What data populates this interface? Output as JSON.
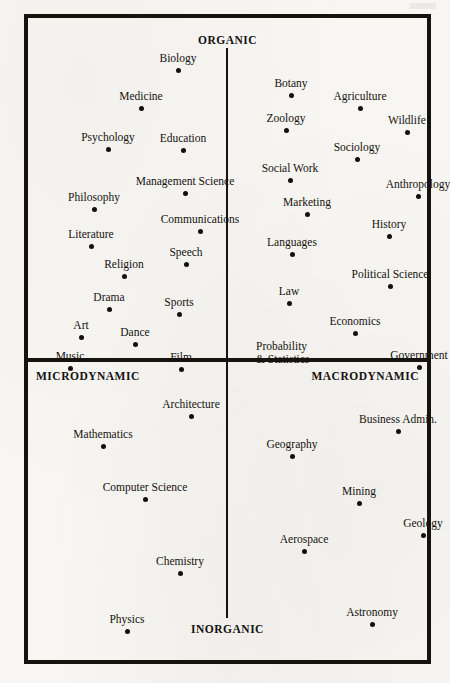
{
  "figure": {
    "type": "scatter",
    "poles": {
      "top": "ORGANIC",
      "bottom": "INORGANIC",
      "left": "MICRODYNAMIC",
      "right": "MACRODYNAMIC"
    }
  },
  "chart_data": {
    "type": "scatter",
    "title": "",
    "xlabel": "MICRODYNAMIC — MACRODYNAMIC",
    "ylabel": "INORGANIC — ORGANIC",
    "xlim": [
      -100,
      100
    ],
    "ylim": [
      -100,
      100
    ],
    "grid": false,
    "legend": null,
    "axis_poles": {
      "top": "ORGANIC",
      "bottom": "INORGANIC",
      "left": "MICRODYNAMIC",
      "right": "MACRODYNAMIC"
    },
    "quadrants": [
      {
        "name": "Organic / Microdynamic",
        "position": "top-left"
      },
      {
        "name": "Organic / Macrodynamic",
        "position": "top-right"
      },
      {
        "name": "Inorganic / Microdynamic",
        "position": "bottom-left"
      },
      {
        "name": "Inorganic / Macrodynamic",
        "position": "bottom-right"
      }
    ],
    "points": [
      {
        "label": "Biology",
        "px": 150,
        "py": 52,
        "quadrant": "top-left",
        "lbl": "above"
      },
      {
        "label": "Medicine",
        "px": 113,
        "py": 90,
        "quadrant": "top-left",
        "lbl": "above"
      },
      {
        "label": "Psychology",
        "px": 80,
        "py": 131,
        "quadrant": "top-left",
        "lbl": "above"
      },
      {
        "label": "Education",
        "px": 155,
        "py": 132,
        "quadrant": "top-left",
        "lbl": "above"
      },
      {
        "label": "Management Science",
        "px": 157,
        "py": 175,
        "quadrant": "top-left",
        "lbl": "above"
      },
      {
        "label": "Philosophy",
        "px": 66,
        "py": 191,
        "quadrant": "top-left",
        "lbl": "above"
      },
      {
        "label": "Communications",
        "px": 172,
        "py": 213,
        "quadrant": "top-left",
        "lbl": "above"
      },
      {
        "label": "Literature",
        "px": 63,
        "py": 228,
        "quadrant": "top-left",
        "lbl": "above"
      },
      {
        "label": "Speech",
        "px": 158,
        "py": 246,
        "quadrant": "top-left",
        "lbl": "above"
      },
      {
        "label": "Religion",
        "px": 96,
        "py": 258,
        "quadrant": "top-left",
        "lbl": "above"
      },
      {
        "label": "Drama",
        "px": 81,
        "py": 291,
        "quadrant": "top-left",
        "lbl": "above"
      },
      {
        "label": "Sports",
        "px": 151,
        "py": 296,
        "quadrant": "top-left",
        "lbl": "above"
      },
      {
        "label": "Art",
        "px": 53,
        "py": 319,
        "quadrant": "top-left",
        "lbl": "above"
      },
      {
        "label": "Dance",
        "px": 107,
        "py": 326,
        "quadrant": "top-left",
        "lbl": "above"
      },
      {
        "label": "Music",
        "px": 42,
        "py": 350,
        "quadrant": "top-left",
        "lbl": "above"
      },
      {
        "label": "Film",
        "px": 153,
        "py": 351,
        "quadrant": "top-left",
        "lbl": "above"
      },
      {
        "label": "Botany",
        "px": 263,
        "py": 77,
        "quadrant": "top-right",
        "lbl": "above"
      },
      {
        "label": "Agriculture",
        "px": 332,
        "py": 90,
        "quadrant": "top-right",
        "lbl": "above"
      },
      {
        "label": "Zoology",
        "px": 258,
        "py": 112,
        "quadrant": "top-right",
        "lbl": "above"
      },
      {
        "label": "Wildlife",
        "px": 379,
        "py": 114,
        "quadrant": "top-right",
        "lbl": "above"
      },
      {
        "label": "Sociology",
        "px": 329,
        "py": 141,
        "quadrant": "top-right",
        "lbl": "above"
      },
      {
        "label": "Social Work",
        "px": 262,
        "py": 162,
        "quadrant": "top-right",
        "lbl": "above"
      },
      {
        "label": "Anthropology",
        "px": 390,
        "py": 178,
        "quadrant": "top-right",
        "lbl": "above"
      },
      {
        "label": "Marketing",
        "px": 279,
        "py": 196,
        "quadrant": "top-right",
        "lbl": "above"
      },
      {
        "label": "History",
        "px": 361,
        "py": 218,
        "quadrant": "top-right",
        "lbl": "above"
      },
      {
        "label": "Languages",
        "px": 264,
        "py": 236,
        "quadrant": "top-right",
        "lbl": "above"
      },
      {
        "label": "Political Science",
        "px": 362,
        "py": 268,
        "quadrant": "top-right",
        "lbl": "above"
      },
      {
        "label": "Law",
        "px": 261,
        "py": 285,
        "quadrant": "top-right",
        "lbl": "above"
      },
      {
        "label": "Economics",
        "px": 327,
        "py": 315,
        "quadrant": "top-right",
        "lbl": "above"
      },
      {
        "label": "Probability\n& Statistics",
        "px": 228,
        "py": 349,
        "quadrant": "top-right",
        "lbl": "block"
      },
      {
        "label": "Government",
        "px": 391,
        "py": 349,
        "quadrant": "top-right",
        "lbl": "above"
      },
      {
        "label": "Architecture",
        "px": 163,
        "py": 398,
        "quadrant": "bottom-left",
        "lbl": "above"
      },
      {
        "label": "Mathematics",
        "px": 75,
        "py": 428,
        "quadrant": "bottom-left",
        "lbl": "above"
      },
      {
        "label": "Computer Science",
        "px": 117,
        "py": 481,
        "quadrant": "bottom-left",
        "lbl": "above"
      },
      {
        "label": "Chemistry",
        "px": 152,
        "py": 555,
        "quadrant": "bottom-left",
        "lbl": "above"
      },
      {
        "label": "Physics",
        "px": 99,
        "py": 613,
        "quadrant": "bottom-left",
        "lbl": "above"
      },
      {
        "label": "Business Admin.",
        "px": 370,
        "py": 413,
        "quadrant": "bottom-right",
        "lbl": "above"
      },
      {
        "label": "Geography",
        "px": 264,
        "py": 438,
        "quadrant": "bottom-right",
        "lbl": "above"
      },
      {
        "label": "Mining",
        "px": 331,
        "py": 485,
        "quadrant": "bottom-right",
        "lbl": "above"
      },
      {
        "label": "Geology",
        "px": 395,
        "py": 517,
        "quadrant": "bottom-right",
        "lbl": "above"
      },
      {
        "label": "Aerospace",
        "px": 276,
        "py": 533,
        "quadrant": "bottom-right",
        "lbl": "above"
      },
      {
        "label": "Astronomy",
        "px": 344,
        "py": 606,
        "quadrant": "bottom-right",
        "lbl": "above"
      }
    ]
  }
}
